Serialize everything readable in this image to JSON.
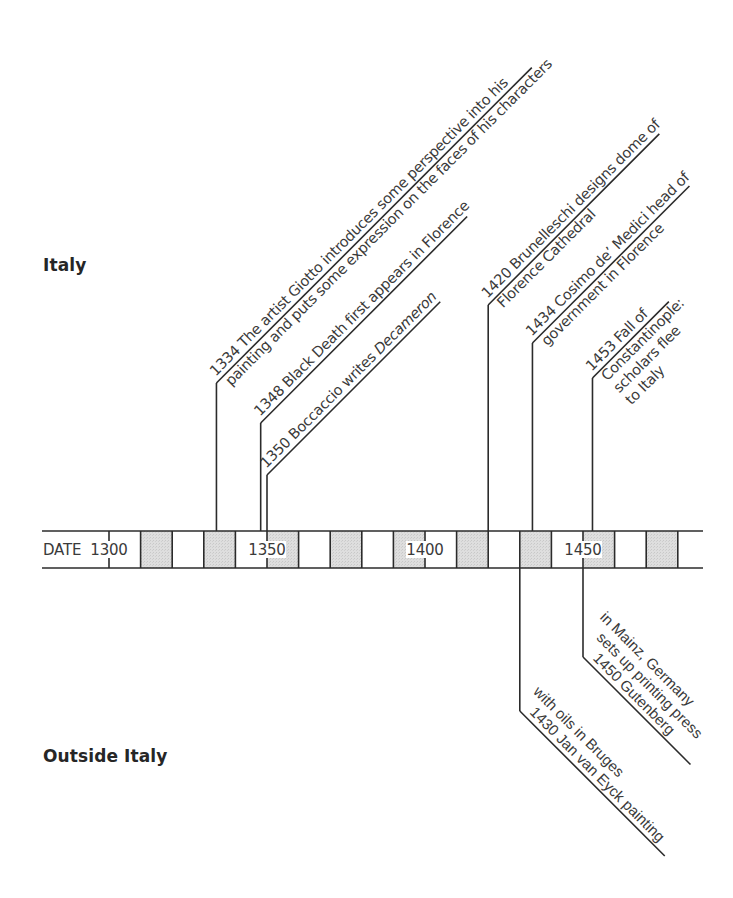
{
  "regions": {
    "upper_label": "Italy",
    "lower_label": "Outside Italy"
  },
  "timeline": {
    "axis_label": "DATE",
    "start_year": 1300,
    "end_year": 1480,
    "cell_years": 10,
    "tick_labels": [
      {
        "year": 1300,
        "label": "1300"
      },
      {
        "year": 1350,
        "label": "1350"
      },
      {
        "year": 1400,
        "label": "1400"
      },
      {
        "year": 1450,
        "label": "1450"
      }
    ],
    "shaded_decades": [
      1310,
      1330,
      1350,
      1370,
      1390,
      1410,
      1430,
      1450,
      1470
    ],
    "shade_color": "#d9d9d9",
    "line_color": "#2b2b2b"
  },
  "events_italy": [
    {
      "year": 1334,
      "lines": [
        [
          {
            "t": "1334 The artist Giotto introduces some perspective into his"
          }
        ],
        [
          {
            "t": "painting and puts some expression on the faces of his characters"
          }
        ]
      ]
    },
    {
      "year": 1348,
      "lines": [
        [
          {
            "t": "1348 Black Death first appears in Florence"
          }
        ]
      ]
    },
    {
      "year": 1350,
      "lines": [
        [
          {
            "t": "1350 Boccaccio writes "
          },
          {
            "t": "Decameron",
            "italic": true
          }
        ]
      ]
    },
    {
      "year": 1420,
      "lines": [
        [
          {
            "t": "1420 Brunelleschi designs dome of"
          }
        ],
        [
          {
            "t": "Florence Cathedral"
          }
        ]
      ]
    },
    {
      "year": 1434,
      "lines": [
        [
          {
            "t": "1434 Cosimo de’ Medici head of"
          }
        ],
        [
          {
            "t": "government in Florence"
          }
        ]
      ]
    },
    {
      "year": 1453,
      "lines": [
        [
          {
            "t": "1453 Fall of"
          }
        ],
        [
          {
            "t": "Constantinople:"
          }
        ],
        [
          {
            "t": "scholars flee"
          }
        ],
        [
          {
            "t": "to Italy"
          }
        ]
      ]
    }
  ],
  "events_outside": [
    {
      "year": 1450,
      "lines": [
        [
          {
            "t": "1450 Gutenberg"
          }
        ],
        [
          {
            "t": "sets up printing press"
          }
        ],
        [
          {
            "t": "in Mainz, Germany"
          }
        ]
      ]
    },
    {
      "year": 1430,
      "lines": [
        [
          {
            "t": "1430 Jan van Eyck painting"
          }
        ],
        [
          {
            "t": "with oils in Bruges"
          }
        ]
      ]
    }
  ]
}
